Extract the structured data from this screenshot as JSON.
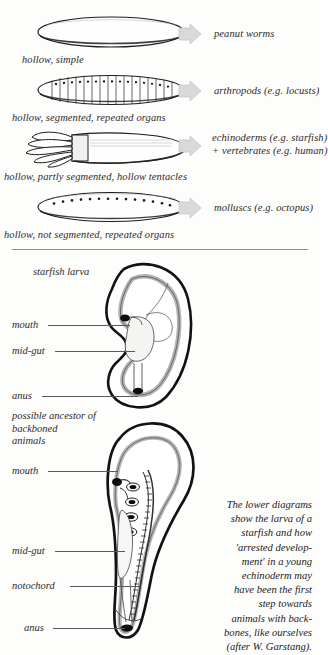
{
  "figure": {
    "body_plan_rows": [
      {
        "id": "peanut-worms",
        "shape": "hollow-simple-ellipse",
        "under_label": "hollow, simple",
        "arrow": "block-arrow-right",
        "group": "peanut worms"
      },
      {
        "id": "arthropods",
        "shape": "segmented-ellipse-with-organs",
        "under_label": "hollow, segmented, repeated organs",
        "arrow": "block-arrow-right",
        "group": "arthropods (e.g. locusts)"
      },
      {
        "id": "echinoderms-vertebrates",
        "shape": "partly-segmented-ellipse-with-tentacles",
        "under_label": "hollow, partly segmented, hollow tentacles",
        "arrow": "block-arrow-right",
        "group": "echinoderms (e.g. starfish)",
        "group_line2": "+ vertebrates (e.g. human)"
      },
      {
        "id": "molluscs",
        "shape": "unsegmented-ellipse-with-dots",
        "under_label": "hollow, not segmented, repeated organs",
        "arrow": "block-arrow-right",
        "group": "molluscs (e.g. octopus)"
      }
    ],
    "upper_diagram": {
      "title": "starfish larva",
      "labels": [
        {
          "id": "mouth",
          "text": "mouth"
        },
        {
          "id": "mid-gut",
          "text": "mid-gut"
        },
        {
          "id": "anus",
          "text": "anus"
        }
      ]
    },
    "lower_diagram": {
      "title": "possible ancestor of backboned animals",
      "title_lines": [
        "possible ancestor of",
        "backboned",
        "animals"
      ],
      "labels": [
        {
          "id": "mouth",
          "text": "mouth"
        },
        {
          "id": "mid-gut",
          "text": "mid-gut"
        },
        {
          "id": "notochord",
          "text": "notochord"
        },
        {
          "id": "anus",
          "text": "anus"
        }
      ]
    },
    "side_caption": {
      "lines": [
        "The lower diagrams",
        "show the larva of a",
        "starfish and how",
        "'arrested develop-",
        "ment' in a young",
        "echinoderm may",
        "have been the first",
        "step towards",
        "animals with back-",
        "bones, like ourselves",
        "(after W. Garstang)."
      ],
      "full_text": "The lower diagrams show the larva of a starfish and how 'arrested development' in a young echinoderm may have been the first step towards animals with backbones, like ourselves (after W. Garstang)."
    },
    "colors": {
      "ink": "#2b2b2b",
      "arrow_fill": "#d8d8d8",
      "arrow_stroke": "#bfbfbf",
      "gut_fill": "#ebebe8",
      "leader": "#5a5a5a",
      "divider": "#8d8d8d",
      "page": "#fdfdfc"
    }
  }
}
